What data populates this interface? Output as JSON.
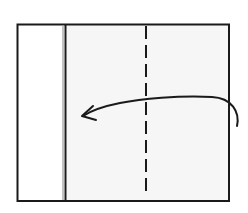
{
  "diagram": {
    "type": "origami-fold-step",
    "colors": {
      "background": "#ffffff",
      "paper_left_panel": "#ffffff",
      "paper_right_panel": "#f6f6f6",
      "outline": "#1a1a1a",
      "inner_edge_gray": "#9a9a9a"
    },
    "elements": {
      "outer_square": {
        "x": 17,
        "y": 24,
        "width": 212,
        "height": 177
      },
      "left_flap": {
        "x": 17,
        "y": 24,
        "width": 47,
        "height": 177
      },
      "right_panel": {
        "x": 65,
        "y": 24,
        "width": 164,
        "height": 177
      },
      "valley_fold_line": {
        "x": 146,
        "y1": 26,
        "y2": 195,
        "style": "dashed"
      },
      "fold_arrow": {
        "direction": "right-to-left",
        "start": [
          237,
          126
        ],
        "end": [
          82,
          116
        ]
      }
    }
  }
}
